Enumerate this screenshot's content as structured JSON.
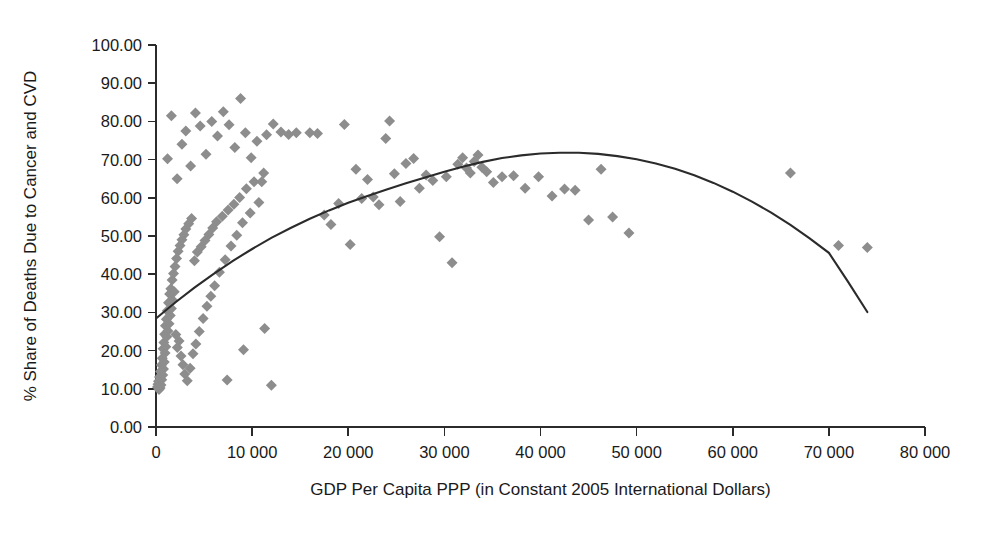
{
  "chart_data": {
    "type": "scatter",
    "title": "",
    "xlabel": "GDP Per Capita PPP (in Constant 2005 International Dollars)",
    "ylabel": "% Share of Deaths Due to Cancer and CVD",
    "xlim": [
      0,
      80000
    ],
    "ylim": [
      0,
      100
    ],
    "grid": false,
    "legend": "none",
    "x_tick_labels": [
      "0",
      "10 000",
      "20 000",
      "30 000",
      "40 000",
      "50 000",
      "60 000",
      "70 000",
      "80 000"
    ],
    "x_tick_values": [
      0,
      10000,
      20000,
      30000,
      40000,
      50000,
      60000,
      70000,
      80000
    ],
    "y_tick_labels": [
      "0.00",
      "10.00",
      "20.00",
      "30.00",
      "40.00",
      "50.00",
      "60.00",
      "70.00",
      "80.00",
      "90.00",
      "100.00"
    ],
    "y_tick_values": [
      0,
      10,
      20,
      30,
      40,
      50,
      60,
      70,
      80,
      90,
      100
    ],
    "marker": {
      "shape": "diamond",
      "color": "#8d8d8d",
      "size": 11
    },
    "trendline": {
      "type": "quadratic",
      "color": "#2b2b2b",
      "x_start": 0,
      "x_end": 74000,
      "points": [
        [
          0,
          28.4
        ],
        [
          2000,
          32.6
        ],
        [
          4000,
          36.5
        ],
        [
          6000,
          40.1
        ],
        [
          8000,
          43.5
        ],
        [
          10000,
          46.6
        ],
        [
          12000,
          49.5
        ],
        [
          14000,
          52.1
        ],
        [
          16000,
          54.5
        ],
        [
          18000,
          56.7
        ],
        [
          20000,
          58.7
        ],
        [
          22000,
          60.5
        ],
        [
          24000,
          62.2
        ],
        [
          26000,
          63.8
        ],
        [
          28000,
          65.3
        ],
        [
          30000,
          66.8
        ],
        [
          32000,
          68.2
        ],
        [
          34000,
          69.4
        ],
        [
          36000,
          70.4
        ],
        [
          38000,
          71.1
        ],
        [
          40000,
          71.6
        ],
        [
          42000,
          71.8
        ],
        [
          44000,
          71.8
        ],
        [
          46000,
          71.5
        ],
        [
          48000,
          70.9
        ],
        [
          50000,
          70.1
        ],
        [
          52000,
          69.0
        ],
        [
          54000,
          67.6
        ],
        [
          56000,
          65.9
        ],
        [
          58000,
          63.9
        ],
        [
          60000,
          61.6
        ],
        [
          62000,
          59.0
        ],
        [
          64000,
          56.1
        ],
        [
          66000,
          52.9
        ],
        [
          68000,
          49.4
        ],
        [
          70000,
          45.6
        ],
        [
          72000,
          38.0
        ],
        [
          74000,
          30.1
        ]
      ]
    },
    "points": [
      [
        150,
        10.5
      ],
      [
        200,
        11.2
      ],
      [
        260,
        12.0
      ],
      [
        310,
        9.8
      ],
      [
        360,
        13.1
      ],
      [
        420,
        10.2
      ],
      [
        470,
        14.5
      ],
      [
        520,
        11.0
      ],
      [
        560,
        16.2
      ],
      [
        600,
        12.4
      ],
      [
        650,
        18.0
      ],
      [
        700,
        13.6
      ],
      [
        740,
        20.5
      ],
      [
        780,
        15.2
      ],
      [
        820,
        22.1
      ],
      [
        860,
        17.0
      ],
      [
        900,
        24.3
      ],
      [
        940,
        19.4
      ],
      [
        980,
        26.5
      ],
      [
        1020,
        21.0
      ],
      [
        1080,
        28.2
      ],
      [
        1120,
        23.6
      ],
      [
        1180,
        30.4
      ],
      [
        1240,
        25.1
      ],
      [
        1300,
        32.5
      ],
      [
        1360,
        27.0
      ],
      [
        1420,
        34.8
      ],
      [
        1480,
        29.2
      ],
      [
        1540,
        36.2
      ],
      [
        1600,
        31.0
      ],
      [
        1680,
        38.5
      ],
      [
        1760,
        33.1
      ],
      [
        1820,
        40.2
      ],
      [
        1900,
        35.4
      ],
      [
        1980,
        42.0
      ],
      [
        2060,
        24.2
      ],
      [
        2140,
        44.1
      ],
      [
        2220,
        20.8
      ],
      [
        2300,
        46.0
      ],
      [
        2400,
        22.5
      ],
      [
        2500,
        47.5
      ],
      [
        2600,
        18.6
      ],
      [
        2700,
        49.0
      ],
      [
        2800,
        16.3
      ],
      [
        2900,
        50.3
      ],
      [
        3000,
        13.9
      ],
      [
        3100,
        51.8
      ],
      [
        3250,
        12.1
      ],
      [
        3400,
        53.2
      ],
      [
        3550,
        15.4
      ],
      [
        3700,
        54.6
      ],
      [
        3850,
        19.2
      ],
      [
        4000,
        43.5
      ],
      [
        4150,
        21.7
      ],
      [
        4300,
        45.8
      ],
      [
        4500,
        25.0
      ],
      [
        4700,
        47.2
      ],
      [
        4900,
        28.4
      ],
      [
        5100,
        48.8
      ],
      [
        5300,
        31.6
      ],
      [
        5500,
        50.4
      ],
      [
        5700,
        34.2
      ],
      [
        5900,
        52.1
      ],
      [
        6100,
        37.0
      ],
      [
        6300,
        53.7
      ],
      [
        6600,
        40.5
      ],
      [
        6900,
        55.2
      ],
      [
        7200,
        43.8
      ],
      [
        7500,
        56.8
      ],
      [
        7800,
        47.4
      ],
      [
        8100,
        58.3
      ],
      [
        8400,
        50.2
      ],
      [
        8700,
        60.1
      ],
      [
        9000,
        53.5
      ],
      [
        9400,
        62.4
      ],
      [
        9800,
        56.0
      ],
      [
        10200,
        64.2
      ],
      [
        10700,
        58.8
      ],
      [
        11200,
        66.5
      ],
      [
        1200,
        70.2
      ],
      [
        1600,
        81.5
      ],
      [
        2200,
        65.0
      ],
      [
        2700,
        74.0
      ],
      [
        3100,
        77.5
      ],
      [
        3600,
        68.3
      ],
      [
        4100,
        82.2
      ],
      [
        4600,
        78.8
      ],
      [
        5200,
        71.4
      ],
      [
        5800,
        80.0
      ],
      [
        6400,
        76.2
      ],
      [
        7000,
        82.5
      ],
      [
        7600,
        79.1
      ],
      [
        8200,
        73.2
      ],
      [
        8800,
        86.0
      ],
      [
        9300,
        77.0
      ],
      [
        9900,
        70.5
      ],
      [
        10500,
        74.8
      ],
      [
        11000,
        64.2
      ],
      [
        11500,
        76.5
      ],
      [
        12200,
        79.3
      ],
      [
        13000,
        77.2
      ],
      [
        13800,
        76.6
      ],
      [
        14600,
        77.0
      ],
      [
        12000,
        10.9
      ],
      [
        11300,
        25.8
      ],
      [
        9100,
        20.2
      ],
      [
        7400,
        12.3
      ],
      [
        16000,
        77.0
      ],
      [
        16800,
        76.8
      ],
      [
        17500,
        55.5
      ],
      [
        18200,
        53.0
      ],
      [
        19000,
        58.5
      ],
      [
        19600,
        79.2
      ],
      [
        20200,
        47.8
      ],
      [
        20800,
        67.5
      ],
      [
        21400,
        59.8
      ],
      [
        22000,
        64.8
      ],
      [
        22600,
        60.2
      ],
      [
        23200,
        58.2
      ],
      [
        23900,
        75.5
      ],
      [
        24300,
        80.1
      ],
      [
        24800,
        66.3
      ],
      [
        25400,
        59.0
      ],
      [
        26000,
        69.0
      ],
      [
        26800,
        70.3
      ],
      [
        27400,
        62.5
      ],
      [
        28100,
        66.0
      ],
      [
        28800,
        64.5
      ],
      [
        29500,
        49.8
      ],
      [
        30200,
        65.5
      ],
      [
        30800,
        43.0
      ],
      [
        31400,
        68.8
      ],
      [
        31900,
        70.5
      ],
      [
        32300,
        67.8
      ],
      [
        32700,
        66.5
      ],
      [
        33100,
        69.5
      ],
      [
        33500,
        71.2
      ],
      [
        33900,
        68.0
      ],
      [
        34400,
        66.8
      ],
      [
        35100,
        64.0
      ],
      [
        36000,
        65.5
      ],
      [
        37200,
        65.8
      ],
      [
        38400,
        62.5
      ],
      [
        39800,
        65.5
      ],
      [
        41200,
        60.5
      ],
      [
        42500,
        62.3
      ],
      [
        43600,
        62.0
      ],
      [
        45000,
        54.2
      ],
      [
        46300,
        67.5
      ],
      [
        47500,
        55.0
      ],
      [
        49200,
        50.8
      ],
      [
        66000,
        66.5
      ],
      [
        71000,
        47.5
      ],
      [
        74000,
        47.0
      ]
    ]
  }
}
